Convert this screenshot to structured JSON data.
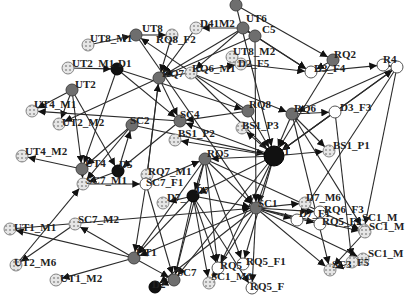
{
  "diagram": {
    "type": "directed-network",
    "colors": {
      "edge": "#2a2a2a",
      "node_gray": "#6e6e6e",
      "node_black": "#111111",
      "node_white": "#ffffff",
      "node_hatched": "#d8d8d8",
      "label": "#222222"
    },
    "nodes": [
      {
        "id": "UT8_M1",
        "label": "UT8_M1",
        "x": 88,
        "y": 45,
        "style": "hatched",
        "lx": 90,
        "ly": 42
      },
      {
        "id": "UT8",
        "label": "UT8",
        "x": 136,
        "y": 35,
        "style": "gray",
        "lx": 142,
        "ly": 32
      },
      {
        "id": "RQ8_F2",
        "label": "RQ8_F2",
        "x": 172,
        "y": 35,
        "style": "hatched",
        "lx": 156,
        "ly": 43
      },
      {
        "id": "D4_M1",
        "label": "D41M2",
        "x": 196,
        "y": 28,
        "style": "hatched",
        "lx": 200,
        "ly": 27
      },
      {
        "id": "UT6",
        "label": "UT6",
        "x": 243,
        "y": 28,
        "style": "gray",
        "lx": 246,
        "ly": 22
      },
      {
        "id": "C5",
        "label": "C5",
        "x": 255,
        "y": 36,
        "style": "gray",
        "lx": 262,
        "ly": 33
      },
      {
        "id": "UT2_M1",
        "label": "UT2_M1",
        "x": 68,
        "y": 68,
        "style": "hatched",
        "lx": 72,
        "ly": 67
      },
      {
        "id": "D1",
        "label": "D1",
        "x": 117,
        "y": 69,
        "style": "black",
        "lx": 118,
        "ly": 67
      },
      {
        "id": "RQ7",
        "label": "RQ7",
        "x": 159,
        "y": 78,
        "style": "gray",
        "lx": 162,
        "ly": 77
      },
      {
        "id": "RQ6_M1",
        "label": "RQ6_M1",
        "x": 191,
        "y": 73,
        "style": "hatched",
        "lx": 192,
        "ly": 72
      },
      {
        "id": "UT8_M2",
        "label": "UT8_M2",
        "x": 232,
        "y": 57,
        "style": "hatched",
        "lx": 233,
        "ly": 55
      },
      {
        "id": "D2_F5",
        "label": "D2_F5",
        "x": 241,
        "y": 64,
        "style": "hatched",
        "lx": 238,
        "ly": 67
      },
      {
        "id": "RQ2",
        "label": "RQ2",
        "x": 333,
        "y": 60,
        "style": "gray",
        "lx": 334,
        "ly": 58
      },
      {
        "id": "D3_F4",
        "label": "D3_F4",
        "x": 311,
        "y": 72,
        "style": "white",
        "lx": 314,
        "ly": 72
      },
      {
        "id": "RQ4a",
        "label": "R4",
        "x": 383,
        "y": 65,
        "style": "white",
        "lx": 383,
        "ly": 63
      },
      {
        "id": "RQ4b",
        "label": "",
        "x": 397,
        "y": 67,
        "style": "white",
        "lx": 0,
        "ly": 0
      },
      {
        "id": "UT2",
        "label": "UT2",
        "x": 72,
        "y": 90,
        "style": "gray",
        "lx": 75,
        "ly": 88
      },
      {
        "id": "UT4_M1",
        "label": "UT4_M1",
        "x": 32,
        "y": 111,
        "style": "hatched",
        "lx": 34,
        "ly": 108
      },
      {
        "id": "UT2_M2",
        "label": "UT2_M2",
        "x": 59,
        "y": 124,
        "style": "hatched",
        "lx": 62,
        "ly": 126
      },
      {
        "id": "SC2",
        "label": "SC2",
        "x": 132,
        "y": 125,
        "style": "gray",
        "lx": 130,
        "ly": 124
      },
      {
        "id": "SC4",
        "label": "SC4",
        "x": 180,
        "y": 121,
        "style": "gray",
        "lx": 180,
        "ly": 118
      },
      {
        "id": "RQ8",
        "label": "RQ8",
        "x": 248,
        "y": 111,
        "style": "gray",
        "lx": 249,
        "ly": 108
      },
      {
        "id": "RQ6",
        "label": "RQ6",
        "x": 292,
        "y": 114,
        "style": "gray",
        "lx": 294,
        "ly": 112
      },
      {
        "id": "D3_F3",
        "label": "D3_F3",
        "x": 335,
        "y": 112,
        "style": "white",
        "lx": 340,
        "ly": 111
      },
      {
        "id": "BS1_P2",
        "label": "BS1_P2",
        "x": 175,
        "y": 140,
        "style": "hatched",
        "lx": 178,
        "ly": 137
      },
      {
        "id": "BS1_P3",
        "label": "BS1_P3",
        "x": 242,
        "y": 128,
        "style": "hatched",
        "lx": 242,
        "ly": 129
      },
      {
        "id": "BS1_P1",
        "label": "BS1_P1",
        "x": 329,
        "y": 151,
        "style": "hatched",
        "lx": 333,
        "ly": 149
      },
      {
        "id": "RQ5",
        "label": "RQ5",
        "x": 205,
        "y": 159,
        "style": "gray",
        "lx": 207,
        "ly": 157
      },
      {
        "id": "HUB",
        "label": "1",
        "x": 274,
        "y": 156,
        "style": "black-big",
        "lx": 284,
        "ly": 155
      },
      {
        "id": "UT4_M2",
        "label": "UT4_M2",
        "x": 22,
        "y": 156,
        "style": "hatched",
        "lx": 25,
        "ly": 155
      },
      {
        "id": "UT4",
        "label": "UT4",
        "x": 82,
        "y": 169,
        "style": "gray",
        "lx": 85,
        "ly": 167
      },
      {
        "id": "D5",
        "label": "D5",
        "x": 118,
        "y": 171,
        "style": "black",
        "lx": 119,
        "ly": 168
      },
      {
        "id": "RQ7_M1",
        "label": "RQ7_M1",
        "x": 147,
        "y": 175,
        "style": "hatched",
        "lx": 148,
        "ly": 175
      },
      {
        "id": "SC7_F1",
        "label": "SC7_F1",
        "x": 146,
        "y": 184,
        "style": "white",
        "lx": 146,
        "ly": 186
      },
      {
        "id": "SC7_M1",
        "label": "SC7_M1",
        "x": 83,
        "y": 184,
        "style": "hatched",
        "lx": 86,
        "ly": 184
      },
      {
        "id": "D7_M5",
        "label": "D7_",
        "x": 163,
        "y": 203,
        "style": "hatched",
        "lx": 167,
        "ly": 201
      },
      {
        "id": "D7",
        "label": "D7",
        "x": 193,
        "y": 196,
        "style": "black",
        "lx": 196,
        "ly": 194
      },
      {
        "id": "SC1",
        "label": "SC1",
        "x": 256,
        "y": 208,
        "style": "gray",
        "lx": 258,
        "ly": 207
      },
      {
        "id": "D7_M6",
        "label": "D7_M6",
        "x": 305,
        "y": 203,
        "style": "hatched",
        "lx": 306,
        "ly": 201
      },
      {
        "id": "RQ6_F3",
        "label": "RQ6_F3",
        "x": 320,
        "y": 212,
        "style": "white",
        "lx": 324,
        "ly": 213
      },
      {
        "id": "D7_F1",
        "label": "D7_F1",
        "x": 297,
        "y": 220,
        "style": "white",
        "lx": 299,
        "ly": 217
      },
      {
        "id": "RQ5_F2",
        "label": "RQ5_F2",
        "x": 320,
        "y": 224,
        "style": "white",
        "lx": 322,
        "ly": 225
      },
      {
        "id": "SC1_M1",
        "label": "SC1_M",
        "x": 364,
        "y": 230,
        "style": "hatched",
        "lx": 362,
        "ly": 221
      },
      {
        "id": "SC1_M2",
        "label": "SC1_M",
        "x": 365,
        "y": 232,
        "style": "hatched",
        "lx": 369,
        "ly": 230
      },
      {
        "id": "UT1_M1",
        "label": "UT1_M1",
        "x": 10,
        "y": 229,
        "style": "hatched",
        "lx": 14,
        "ly": 231
      },
      {
        "id": "SC7_M2",
        "label": "SC7_M2",
        "x": 75,
        "y": 224,
        "style": "hatched",
        "lx": 78,
        "ly": 223
      },
      {
        "id": "SC1_M3",
        "label": "SC1_M",
        "x": 363,
        "y": 259,
        "style": "hatched",
        "lx": 368,
        "ly": 257
      },
      {
        "id": "SC1_F5",
        "label": "F5",
        "x": 352,
        "y": 262,
        "style": "hatched",
        "lx": 357,
        "ly": 266
      },
      {
        "id": "SC3",
        "label": "SC3",
        "x": 330,
        "y": 270,
        "style": "hatched",
        "lx": 332,
        "ly": 268
      },
      {
        "id": "UT2_M6",
        "label": "UT2_M6",
        "x": 16,
        "y": 265,
        "style": "hatched",
        "lx": 14,
        "ly": 266
      },
      {
        "id": "UT1",
        "label": "UT1",
        "x": 134,
        "y": 258,
        "style": "gray",
        "lx": 136,
        "ly": 256
      },
      {
        "id": "RQ5b",
        "label": "RQ5",
        "x": 218,
        "y": 268,
        "style": "white",
        "lx": 220,
        "ly": 269
      },
      {
        "id": "RQ5_F1",
        "label": "RQ5_F1",
        "x": 243,
        "y": 264,
        "style": "white",
        "lx": 246,
        "ly": 265
      },
      {
        "id": "UT1_M2",
        "label": "UT1_M2",
        "x": 56,
        "y": 280,
        "style": "hatched",
        "lx": 60,
        "ly": 282
      },
      {
        "id": "SC7",
        "label": "SC7",
        "x": 174,
        "y": 280,
        "style": "gray",
        "lx": 177,
        "ly": 276
      },
      {
        "id": "SC1_M6",
        "label": "SC1_M6",
        "x": 209,
        "y": 283,
        "style": "hatched",
        "lx": 211,
        "ly": 280
      },
      {
        "id": "D2",
        "label": "D2",
        "x": 155,
        "y": 287,
        "style": "black",
        "lx": 152,
        "ly": 288
      },
      {
        "id": "RQ5_F3",
        "label": "RQ5_F",
        "x": 252,
        "y": 288,
        "style": "white",
        "lx": 250,
        "ly": 290
      },
      {
        "id": "TOPA",
        "label": "",
        "x": 236,
        "y": 5,
        "style": "gray",
        "lx": 0,
        "ly": 0
      }
    ],
    "edges": [
      [
        "UT8_M1",
        "UT8"
      ],
      [
        "UT8",
        "RQ8_F2"
      ],
      [
        "RQ8_F2",
        "RQ7"
      ],
      [
        "D4_M1",
        "RQ7"
      ],
      [
        "UT6",
        "RQ7"
      ],
      [
        "C5",
        "RQ7"
      ],
      [
        "UT6",
        "D4_M1"
      ],
      [
        "UT6",
        "C5"
      ],
      [
        "C5",
        "D3_F4"
      ],
      [
        "UT6",
        "D3_F4"
      ],
      [
        "UT6",
        "RQ6_M1"
      ],
      [
        "UT2_M1",
        "D1"
      ],
      [
        "D1",
        "RQ8"
      ],
      [
        "D1",
        "SC4"
      ],
      [
        "D1",
        "UT4"
      ],
      [
        "RQ7",
        "SC4"
      ],
      [
        "RQ7",
        "UT2_M2"
      ],
      [
        "RQ7",
        "D2_F5"
      ],
      [
        "RQ7",
        "SC7_F1"
      ],
      [
        "RQ6_M1",
        "RQ6"
      ],
      [
        "RQ6_M1",
        "HUB"
      ],
      [
        "D2_F5",
        "D3_F4"
      ],
      [
        "UT2",
        "UT4_M1"
      ],
      [
        "UT2",
        "UT2_M2"
      ],
      [
        "UT2",
        "D5"
      ],
      [
        "UT2",
        "UT4"
      ],
      [
        "RQ2",
        "D3_F4"
      ],
      [
        "RQ2",
        "HUB"
      ],
      [
        "D3_F4",
        "RQ4a"
      ],
      [
        "RQ4a",
        "RQ4b"
      ],
      [
        "RQ4b",
        "RQ6"
      ],
      [
        "RQ4b",
        "HUB"
      ],
      [
        "RQ8",
        "SC4"
      ],
      [
        "RQ8",
        "HUB"
      ],
      [
        "RQ8",
        "UT8"
      ],
      [
        "SC2",
        "HUB"
      ],
      [
        "SC2",
        "SC7_M1"
      ],
      [
        "SC2",
        "UT4"
      ],
      [
        "SC4",
        "UT4_M1"
      ],
      [
        "SC4",
        "D5"
      ],
      [
        "RQ6",
        "D3_F3"
      ],
      [
        "RQ6",
        "HUB"
      ],
      [
        "RQ6",
        "SC1_M1"
      ],
      [
        "RQ6",
        "SC3"
      ],
      [
        "RQ6",
        "BS1_P1"
      ],
      [
        "D3_F3",
        "SC1_F5"
      ],
      [
        "D3_F3",
        "HUB"
      ],
      [
        "HUB",
        "BS1_P1"
      ],
      [
        "HUB",
        "BS1_P2"
      ],
      [
        "HUB",
        "BS1_P3"
      ],
      [
        "HUB",
        "SC4"
      ],
      [
        "HUB",
        "SC1"
      ],
      [
        "HUB",
        "D7"
      ],
      [
        "HUB",
        "RQ5"
      ],
      [
        "HUB",
        "SC7"
      ],
      [
        "HUB",
        "RQ5b"
      ],
      [
        "HUB",
        "RQ5_F1"
      ],
      [
        "HUB",
        "RQ4b"
      ],
      [
        "UT4",
        "UT4_M2"
      ],
      [
        "UT4",
        "SC7_M1"
      ],
      [
        "D5",
        "SC7_M1"
      ],
      [
        "D5",
        "SC2"
      ],
      [
        "SC7_M1",
        "SC7_F1"
      ],
      [
        "SC7_F1",
        "UT1"
      ],
      [
        "SC7_F1",
        "SC7"
      ],
      [
        "SC7_F1",
        "RQ5"
      ],
      [
        "RQ7_M1",
        "RQ7"
      ],
      [
        "RQ5",
        "D7"
      ],
      [
        "RQ5",
        "UT1"
      ],
      [
        "RQ5",
        "SC1"
      ],
      [
        "RQ5",
        "RQ5b"
      ],
      [
        "RQ5",
        "RQ5_F1"
      ],
      [
        "RQ5",
        "SC7"
      ],
      [
        "RQ5",
        "SC1_M2"
      ],
      [
        "D7",
        "D7_M5"
      ],
      [
        "D7",
        "SC1"
      ],
      [
        "D7",
        "SC7"
      ],
      [
        "D7",
        "RQ5b"
      ],
      [
        "D7",
        "RQ5_F3"
      ],
      [
        "D7",
        "SC1_M6"
      ],
      [
        "D7",
        "UT1"
      ],
      [
        "SC1",
        "D7_M6"
      ],
      [
        "SC1",
        "D7_F1"
      ],
      [
        "SC1",
        "RQ6_F3"
      ],
      [
        "SC1",
        "RQ5_F2"
      ],
      [
        "SC1",
        "SC1_M2"
      ],
      [
        "SC1",
        "SC1_M3"
      ],
      [
        "SC1",
        "SC3"
      ],
      [
        "SC1",
        "RQ5_F3"
      ],
      [
        "SC1",
        "SC1_M6"
      ],
      [
        "SC1",
        "UT1"
      ],
      [
        "SC1",
        "D2"
      ],
      [
        "UT1",
        "SC7_M2"
      ],
      [
        "UT1",
        "UT1_M1"
      ],
      [
        "UT1",
        "UT1_M2"
      ],
      [
        "UT1",
        "SC7"
      ],
      [
        "SC7_M2",
        "UT2_M6"
      ],
      [
        "UT2_M6",
        "SC7_M1"
      ],
      [
        "UT1_M1",
        "SC1"
      ],
      [
        "SC7",
        "D2"
      ],
      [
        "SC1_M2",
        "SC3"
      ],
      [
        "SC1_M3",
        "SC3"
      ],
      [
        "RQ4b",
        "SC1_M1"
      ],
      [
        "RQ4b",
        "D7_F1"
      ],
      [
        "TOPA",
        "HUB"
      ],
      [
        "TOPA",
        "RQ2"
      ],
      [
        "UT8",
        "SC1"
      ],
      [
        "C5",
        "SC1"
      ]
    ]
  }
}
